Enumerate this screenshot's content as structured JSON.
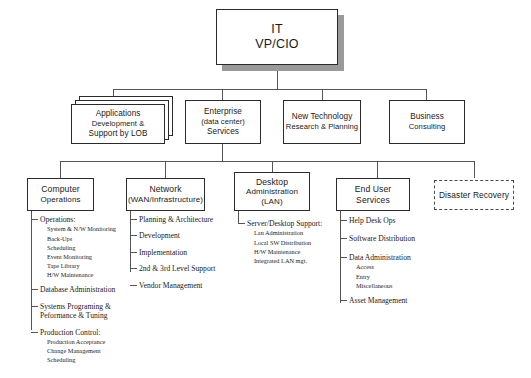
{
  "chart": {
    "root": {
      "line1": "IT",
      "line2": "VP/CIO"
    },
    "tier2": [
      {
        "line1": "Applications",
        "line2": "Development &",
        "line3": "Support by LOB",
        "stacked": true
      },
      {
        "line1": "Enterprise",
        "line2": "(data center)",
        "line3": "Services",
        "stacked": false
      },
      {
        "line1": "New Technology",
        "line2": "Research & Planning",
        "line3": "",
        "stacked": false
      },
      {
        "line1": "Business",
        "line2": "Consulting",
        "line3": "",
        "stacked": false
      }
    ],
    "tier3": [
      {
        "line1": "Computer",
        "line2": "Operations",
        "line3": "",
        "dashed": false,
        "items": [
          {
            "label": "Operations:",
            "leaves": [
              "System & N/W Monitoring",
              "Back-Ups",
              "Scheduling",
              "Event Monitoring",
              "Tape Library",
              "H/W Maintenance"
            ]
          },
          {
            "label": "Database Administration",
            "leaves": []
          },
          {
            "label": "Systems Programing & Peformance & Tuning",
            "leaves": []
          },
          {
            "label": "Production Control:",
            "leaves": [
              "Production Acceptance",
              "Change Management",
              "Scheduling"
            ]
          }
        ]
      },
      {
        "line1": "Network",
        "line2": "(WAN/Infrastructure)",
        "line3": "",
        "dashed": false,
        "items": [
          {
            "label": "Planning & Architecture",
            "leaves": []
          },
          {
            "label": "Development",
            "leaves": []
          },
          {
            "label": "Implementation",
            "leaves": []
          },
          {
            "label": "2nd & 3rd Level Support",
            "leaves": []
          },
          {
            "label": "Vendor Management",
            "leaves": []
          }
        ]
      },
      {
        "line1": "Desktop",
        "line2": "Administration",
        "line3": "(LAN)",
        "dashed": false,
        "items": [
          {
            "label": "Server/Desktop Support:",
            "leaves": [
              "Lan Administration",
              "Local SW Distribution",
              "H/W Maintenance",
              "Integrated LAN  mgt."
            ]
          }
        ]
      },
      {
        "line1": "End User Services",
        "line2": "",
        "line3": "",
        "dashed": false,
        "items": [
          {
            "label": "Help Desk Ops",
            "leaves": []
          },
          {
            "label": "Software Distribution",
            "leaves": []
          },
          {
            "label": "Data Administration",
            "leaves": [
              "Access",
              "Entry",
              "Miscellaneous"
            ]
          },
          {
            "label": "Asset Management",
            "leaves": []
          }
        ]
      },
      {
        "line1": "Disaster Recovery",
        "line2": "",
        "line3": "",
        "dashed": true,
        "items": []
      }
    ]
  }
}
